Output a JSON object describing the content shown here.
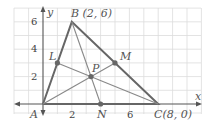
{
  "diagram": {
    "type": "triangle-medians-on-grid",
    "axes": {
      "x_label": "x",
      "y_label": "y",
      "x_ticks": [
        "2",
        "6"
      ],
      "y_ticks": [
        "2",
        "4",
        "6"
      ]
    },
    "points": {
      "A": {
        "label": "A",
        "coords": [
          0,
          0
        ]
      },
      "B": {
        "label": "B (2, 6)",
        "coords": [
          2,
          6
        ]
      },
      "C": {
        "label": "C(8, 0)",
        "coords": [
          8,
          0
        ]
      },
      "L": {
        "label": "L",
        "coords": [
          1,
          3
        ]
      },
      "M": {
        "label": "M",
        "coords": [
          5,
          3
        ]
      },
      "N": {
        "label": "N",
        "coords": [
          4,
          0
        ]
      },
      "P": {
        "label": "P",
        "coords": [
          3.33,
          2
        ]
      }
    },
    "colors": {
      "grid": "#dcdcdc",
      "triangle": "#666666",
      "median": "#777777",
      "point": "#666666",
      "axis": "#555555"
    }
  }
}
